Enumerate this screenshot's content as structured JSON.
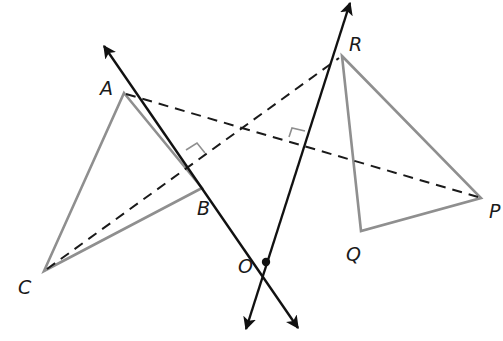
{
  "diagram": {
    "type": "geometry-rotation",
    "colors": {
      "triangle": "#8f8f8f",
      "line": "#111111",
      "dash": "#1a1a1a",
      "label": "#1a1a1a"
    },
    "points": {
      "A": {
        "label": "A",
        "x": 124,
        "y": 93
      },
      "B": {
        "label": "B",
        "x": 202,
        "y": 188
      },
      "C": {
        "label": "C",
        "x": 44,
        "y": 271
      },
      "R": {
        "label": "R",
        "x": 342,
        "y": 56
      },
      "P": {
        "label": "P",
        "x": 481,
        "y": 198
      },
      "Q": {
        "label": "Q",
        "x": 361,
        "y": 231
      },
      "O": {
        "label": "O",
        "x": 266,
        "y": 262
      }
    },
    "triangles": [
      {
        "name": "ABC",
        "vertices": [
          "A",
          "B",
          "C"
        ]
      },
      {
        "name": "RPQ",
        "vertices": [
          "R",
          "P",
          "Q"
        ]
      }
    ],
    "dashed_segments": [
      {
        "from": "A",
        "to": "P"
      },
      {
        "from": "C",
        "to": "R"
      }
    ],
    "bisector_lines": [
      {
        "name": "perpendicular bisector of AP",
        "through": "O",
        "arrow_ends": true
      },
      {
        "name": "perpendicular bisector of CR",
        "through": "O",
        "arrow_ends": true
      }
    ],
    "right_angle_marks": 2,
    "labels": {
      "A": "A",
      "B": "B",
      "C": "C",
      "R": "R",
      "P": "P",
      "Q": "Q",
      "O": "O"
    }
  }
}
